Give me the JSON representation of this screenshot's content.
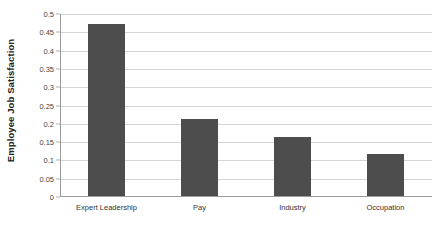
{
  "chart_data": {
    "type": "bar",
    "title": "",
    "xlabel": "",
    "ylabel": "Employee Job Satisfaction",
    "categories": [
      "Expert Leadership",
      "Pay",
      "Industry",
      "Occupation"
    ],
    "values": [
      0.47,
      0.21,
      0.16,
      0.115
    ],
    "ylim": [
      0,
      0.5
    ],
    "ytick_values": [
      0,
      0.05,
      0.1,
      0.15,
      0.2,
      0.25,
      0.3,
      0.35,
      0.4,
      0.45,
      0.5
    ],
    "ytick_labels": [
      "0",
      "0.05",
      "0.1",
      "0.15",
      "0.2",
      "0.25",
      "0.3",
      "0.35",
      "0.4",
      "0.45",
      "0.5"
    ],
    "grid": true,
    "grid_axis": "y",
    "legend": false,
    "legend_position": "none",
    "series": [
      {
        "name": "Employee Job Satisfaction",
        "values": [
          0.47,
          0.21,
          0.16,
          0.115
        ]
      }
    ],
    "bar_color": "#4d4d4d",
    "gridline_color": "#d4d4d4",
    "axis_color": "#9a9a9a",
    "background_color": "#ffffff"
  }
}
